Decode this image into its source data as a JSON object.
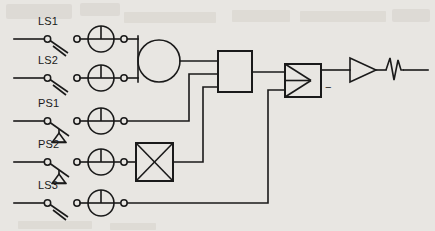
{
  "diagram": {
    "background_color": "#e8e6e2",
    "line_color": "#1a1a1a",
    "inputs": [
      {
        "id": "ls1",
        "label": "LS1",
        "switch_type": "limit-switch",
        "row_y": 39,
        "label_x": 38,
        "label_y": 25
      },
      {
        "id": "ls2",
        "label": "LS2",
        "switch_type": "limit-switch",
        "row_y": 78,
        "label_x": 38,
        "label_y": 64
      },
      {
        "id": "ps1",
        "label": "PS1",
        "switch_type": "pressure-switch",
        "row_y": 121,
        "label_x": 38,
        "label_y": 107
      },
      {
        "id": "ps2",
        "label": "PS2",
        "switch_type": "pressure-switch",
        "row_y": 162,
        "label_x": 38,
        "label_y": 148
      },
      {
        "id": "ls3",
        "label": "LS3",
        "switch_type": "limit-switch",
        "row_y": 203,
        "label_x": 38,
        "label_y": 189
      }
    ],
    "blocks": [
      {
        "id": "summing-junction",
        "type": "circle",
        "cx": 159,
        "cy": 61,
        "r": 21
      },
      {
        "id": "processing-block",
        "type": "rectangle",
        "x": 218,
        "y": 51,
        "width": 34,
        "height": 41
      },
      {
        "id": "crossed-block",
        "type": "crossed-rectangle",
        "x": 136,
        "y": 143,
        "width": 37,
        "height": 38
      },
      {
        "id": "comparator-block",
        "type": "comparator",
        "x": 285,
        "y": 64,
        "width": 36,
        "height": 33,
        "marking": "−"
      },
      {
        "id": "amplifier",
        "type": "triangle",
        "x": 350,
        "y": 58,
        "width": 26,
        "height": 24
      },
      {
        "id": "resistor",
        "type": "zigzag",
        "x": 386,
        "y": 70
      }
    ],
    "output_line": {
      "from_x": 404,
      "to_x": 428,
      "y": 70
    }
  }
}
